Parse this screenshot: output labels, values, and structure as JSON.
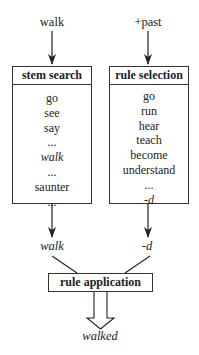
{
  "inputs": {
    "stem_input": "walk",
    "feature_input": "+past"
  },
  "stem_search": {
    "title": "stem search",
    "items": [
      {
        "text": "go",
        "italic": false
      },
      {
        "text": "see",
        "italic": false
      },
      {
        "text": "say",
        "italic": false
      },
      {
        "text": "...",
        "italic": false
      },
      {
        "text": "walk",
        "italic": true
      },
      {
        "text": "...",
        "italic": false
      },
      {
        "text": "saunter",
        "italic": false
      },
      {
        "text": "...",
        "italic": false
      }
    ]
  },
  "rule_selection": {
    "title": "rule selection",
    "items": [
      {
        "text": "go",
        "italic": false
      },
      {
        "text": "run",
        "italic": false
      },
      {
        "text": "hear",
        "italic": false
      },
      {
        "text": "teach",
        "italic": false
      },
      {
        "text": "become",
        "italic": false
      },
      {
        "text": "understand",
        "italic": false
      },
      {
        "text": "...",
        "italic": false
      },
      {
        "text": "-d",
        "italic": true
      }
    ]
  },
  "outputs": {
    "stem_output": "walk",
    "rule_output": "-d"
  },
  "rule_application": {
    "title": "rule application"
  },
  "result": "walked"
}
